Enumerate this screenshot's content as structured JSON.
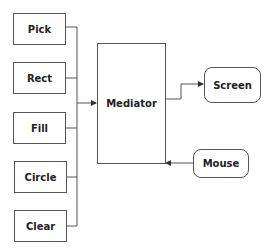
{
  "diagram": {
    "components": [
      {
        "id": "pick",
        "label": "Pick"
      },
      {
        "id": "rect",
        "label": "Rect"
      },
      {
        "id": "fill",
        "label": "Fill"
      },
      {
        "id": "circle",
        "label": "Circle"
      },
      {
        "id": "clear",
        "label": "Clear"
      }
    ],
    "mediator": {
      "label": "Mediator"
    },
    "outputs": [
      {
        "id": "screen",
        "label": "Screen"
      }
    ],
    "inputs": [
      {
        "id": "mouse",
        "label": "Mouse"
      }
    ],
    "line_color": "#555555"
  }
}
